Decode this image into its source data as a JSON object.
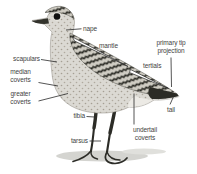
{
  "figure": {
    "type": "bird-topography-diagram",
    "labels": {
      "nape": "nape",
      "mantle": "mantle",
      "primary_tip_projection": "primary tip\nprojection",
      "tertials": "tertials",
      "scapulars": "scapulars",
      "median_coverts": "median\ncoverts",
      "greater_coverts": "greater\ncoverts",
      "tibia": "tibia",
      "tarsus": "tarsus",
      "undertail_coverts": "undertail\ncoverts",
      "tail": "tail"
    },
    "colors": {
      "background": "#ffffff",
      "label_text": "#3f3f3f",
      "pointer_line": "#2a2a2a",
      "bird_light": "#dbd9d3",
      "bird_dark": "#26261f",
      "shadow": "#d4d4d0"
    }
  }
}
